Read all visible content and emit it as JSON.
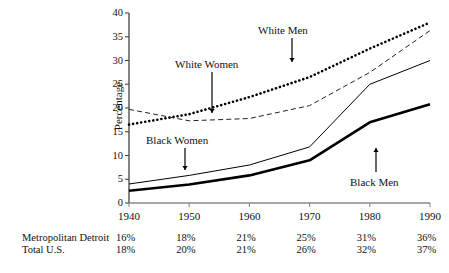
{
  "chart_data": {
    "type": "line",
    "title": "",
    "xlabel": "",
    "ylabel": "Percentage",
    "x": [
      1940,
      1950,
      1960,
      1970,
      1980,
      1990
    ],
    "xlim": [
      1940,
      1990
    ],
    "ylim": [
      0,
      40
    ],
    "yticks": [
      0,
      5,
      10,
      15,
      20,
      25,
      30,
      35,
      40
    ],
    "xticks": [
      "1940",
      "1950",
      "1960",
      "1970",
      "1980",
      "1990"
    ],
    "grid": false,
    "legend_position": "inline-annotations",
    "series": [
      {
        "name": "White Men",
        "style": "dotted-thick",
        "values": [
          16.5,
          18.7,
          22.3,
          26.5,
          32.5,
          38.0
        ]
      },
      {
        "name": "White Women",
        "style": "dashed-thin",
        "values": [
          19.7,
          17.3,
          17.8,
          20.5,
          27.5,
          36.3
        ]
      },
      {
        "name": "Black Women",
        "style": "solid-thin",
        "values": [
          4.0,
          5.8,
          8.0,
          11.8,
          25.0,
          30.0
        ]
      },
      {
        "name": "Black Men",
        "style": "solid-thick",
        "values": [
          2.6,
          3.9,
          5.8,
          9.0,
          17.0,
          20.8
        ]
      }
    ],
    "annotations": [
      {
        "text": "White Men",
        "arrow": "down"
      },
      {
        "text": "White Women",
        "arrow": "down"
      },
      {
        "text": "Black Women",
        "arrow": "down"
      },
      {
        "text": "Black Men",
        "arrow": "up"
      }
    ]
  },
  "axis": {
    "ylabel": "Percentage",
    "yticks": [
      "40",
      "35",
      "30",
      "25",
      "20",
      "15",
      "10",
      "5",
      "0"
    ],
    "xticks": [
      "1940",
      "1950",
      "1960",
      "1970",
      "1980",
      "1990"
    ]
  },
  "annotations": {
    "white_men": "White Men",
    "white_women": "White Women",
    "black_women": "Black Women",
    "black_men": "Black Men"
  },
  "table": {
    "rows": [
      {
        "label": "Metropolitan Detroit",
        "values": [
          "16%",
          "18%",
          "21%",
          "25%",
          "31%",
          "36%"
        ]
      },
      {
        "label": "Total U.S.",
        "values": [
          "18%",
          "20%",
          "21%",
          "26%",
          "32%",
          "37%"
        ]
      }
    ]
  }
}
